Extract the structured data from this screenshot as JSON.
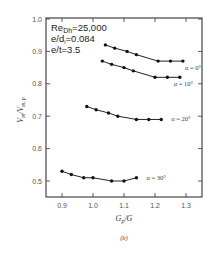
{
  "chart_data": {
    "type": "line",
    "title": "",
    "caption": "(b)",
    "xlabel": "G_p/G",
    "ylabel": "V_m/V_{m,p}",
    "xlim": [
      0.85,
      1.35
    ],
    "ylim": [
      0.45,
      1.0
    ],
    "xticks": [
      0.9,
      1.0,
      1.1,
      1.2,
      1.3
    ],
    "xtick_labels": [
      "0.9",
      "1.0",
      "1.1",
      "1.2",
      "1.3"
    ],
    "yticks": [
      0.5,
      0.6,
      0.7,
      0.8,
      0.9,
      1.0
    ],
    "ytick_labels": [
      "0.5",
      "0.6",
      "0.7",
      "0.8",
      "0.9",
      "1.0"
    ],
    "grid": false,
    "legend": "inline labels at right end of each curve",
    "annotations": [
      "Re_Dh=25,000",
      "e/d_i=0.084",
      "e/t=3.5"
    ],
    "series": [
      {
        "name": "α = 0°",
        "x": [
          1.04,
          1.07,
          1.11,
          1.14,
          1.21,
          1.25,
          1.29
        ],
        "y": [
          0.92,
          0.91,
          0.9,
          0.89,
          0.87,
          0.87,
          0.87
        ]
      },
      {
        "name": "α = 10°",
        "x": [
          1.03,
          1.06,
          1.1,
          1.13,
          1.2,
          1.24,
          1.28
        ],
        "y": [
          0.87,
          0.86,
          0.85,
          0.84,
          0.82,
          0.82,
          0.82
        ]
      },
      {
        "name": "α = 20°",
        "x": [
          0.98,
          1.01,
          1.05,
          1.08,
          1.14,
          1.18,
          1.22
        ],
        "y": [
          0.73,
          0.72,
          0.71,
          0.7,
          0.69,
          0.69,
          0.69
        ]
      },
      {
        "name": "α = 30°",
        "x": [
          0.9,
          0.93,
          0.97,
          1.0,
          1.06,
          1.1,
          1.14
        ],
        "y": [
          0.53,
          0.52,
          0.51,
          0.51,
          0.5,
          0.5,
          0.51
        ]
      }
    ]
  },
  "labels": {
    "annot_re_main": "Re",
    "annot_re_sub": "Dh",
    "annot_re_val": "=25,000",
    "annot_ed_main": "e/d",
    "annot_ed_sub": "i",
    "annot_ed_val": "=0.084",
    "annot_et": "e/t=3.5",
    "xlabel_main": "G",
    "xlabel_sub": "p",
    "xlabel_rest": "/G",
    "ylabel": "V_m/V_m,p",
    "caption": "(b)"
  }
}
